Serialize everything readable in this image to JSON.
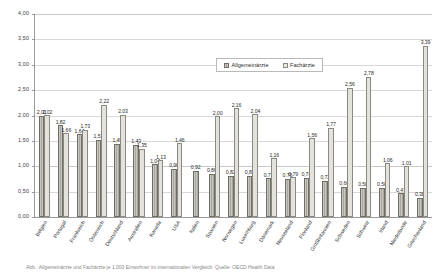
{
  "chart_data": {
    "type": "bar",
    "title": "",
    "xlabel": "",
    "ylabel": "",
    "ylim": [
      0,
      4.0
    ],
    "ytick_labels": [
      "4,00",
      "3,50",
      "3,00",
      "2,50",
      "2,00",
      "1,50",
      "1,00",
      "0,50",
      "0,00"
    ],
    "ytick_values": [
      4.0,
      3.5,
      3.0,
      2.5,
      2.0,
      1.5,
      1.0,
      0.5,
      0.0
    ],
    "grid": true,
    "legend_position": "upper-center",
    "categories": [
      "Belgien",
      "Portugal",
      "Frankreich",
      "Österreich",
      "Deutschland",
      "Australien",
      "Kanada",
      "USA",
      "Italien",
      "Spanien",
      "Norwegen",
      "Luxemburg",
      "Dänemark",
      "Neuseeland",
      "Finnland",
      "Großbritannien",
      "Schweden",
      "Schweiz",
      "Irland",
      "Niederlande",
      "Griechenland"
    ],
    "series": [
      {
        "name": "Allgemeinärzte",
        "color": "#a9a79e",
        "values": [
          2.01,
          1.82,
          1.64,
          1.53,
          1.45,
          1.43,
          1.04,
          0.96,
          0.92,
          0.86,
          0.82,
          0.82,
          0.77,
          0.76,
          0.78,
          0.72,
          0.6,
          0.58,
          0.58,
          0.47,
          0.38
        ],
        "labels": [
          "2,01",
          "1,82",
          "1,64",
          "1,53",
          "1,45",
          "1,43",
          "1,04",
          "0,96",
          "0,92",
          "0,86",
          "0,82",
          "0,82",
          "0,77",
          "0,76",
          "0,78",
          "0,72",
          "0,60",
          "0,58",
          "0,58",
          "0,47",
          "0,38"
        ]
      },
      {
        "name": "Fachärzte",
        "color": "#e3e2dc",
        "values": [
          2.02,
          1.66,
          1.73,
          2.22,
          2.03,
          1.35,
          1.13,
          1.46,
          null,
          2.0,
          2.16,
          2.04,
          1.16,
          0.79,
          1.56,
          1.77,
          2.56,
          2.78,
          1.06,
          1.01,
          3.39
        ],
        "labels": [
          "2,02",
          "1,66",
          "1,73",
          "2,22",
          "2,03",
          "1,35",
          "1,13",
          "1,46",
          "",
          "2,00",
          "2,16",
          "2,04",
          "1,16",
          "0,79",
          "1,56",
          "1,77",
          "2,56",
          "2,78",
          "1,06",
          "1,01",
          "3,39"
        ]
      }
    ]
  },
  "legend": {
    "items": [
      {
        "label": "Allgemeinärzte"
      },
      {
        "label": "Fachärzte"
      }
    ]
  },
  "caption": {
    "text": "Abb.: Allgemeinärzte und Fachärzte je 1.000 Einwohner im internationalen Vergleich. Quelle: OECD Health Data"
  }
}
